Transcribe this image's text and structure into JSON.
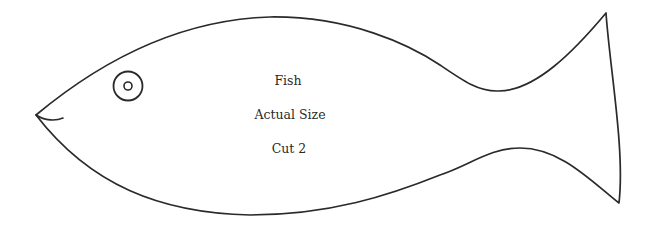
{
  "pattern": {
    "title": "Fish",
    "size_note": "Actual Size",
    "cut_instruction": "Cut 2"
  },
  "colors": {
    "background": "#ffffff",
    "outline": "#2a2a2a",
    "text": "#2a2a2a"
  }
}
